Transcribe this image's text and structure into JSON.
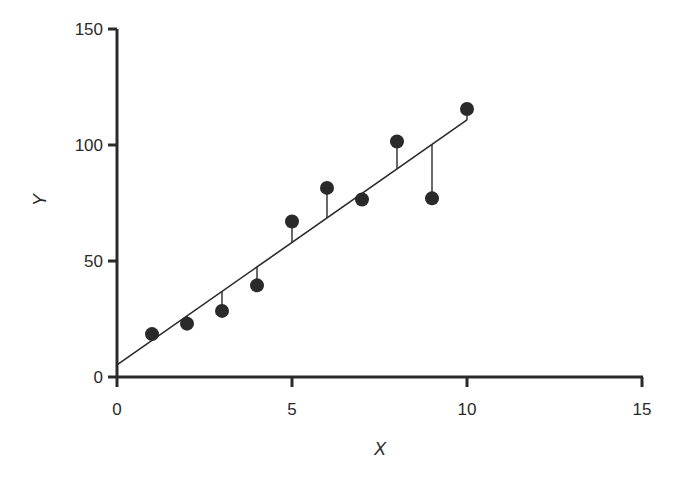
{
  "chart_data": {
    "type": "scatter",
    "title": "",
    "xlabel": "X",
    "ylabel": "Y",
    "xlim": [
      0,
      15
    ],
    "ylim": [
      0,
      150
    ],
    "x_ticks": [
      0,
      5,
      10,
      15
    ],
    "y_ticks": [
      0,
      50,
      100,
      150
    ],
    "x_tick_labels": [
      "0",
      "5",
      "10",
      "15"
    ],
    "y_tick_labels": [
      "0",
      "50",
      "100",
      "150"
    ],
    "grid": false,
    "legend": null,
    "series": [
      {
        "name": "observations",
        "marker": "filled-circle",
        "x": [
          1,
          2,
          3,
          4,
          5,
          6,
          7,
          8,
          9,
          10
        ],
        "y": [
          18.5,
          23,
          28.5,
          39.5,
          67,
          81.5,
          76.5,
          101.5,
          77,
          115.5
        ]
      }
    ],
    "regression_line": {
      "intercept": 5.2,
      "slope": 10.56,
      "x_range": [
        0,
        10
      ]
    },
    "residuals_shown": true,
    "annotations": []
  },
  "colors": {
    "ink": "#2a2a2a",
    "background": "#ffffff"
  }
}
